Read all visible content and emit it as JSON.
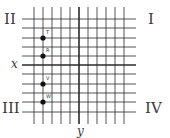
{
  "diagram": {
    "grid": {
      "vertical_lines_x": [
        34,
        43,
        52,
        61,
        70,
        79,
        88,
        97,
        106,
        115,
        124
      ],
      "horizontal_lines_y": [
        19,
        28,
        38,
        47,
        56,
        65,
        74,
        84,
        93,
        102,
        112
      ],
      "v_line_top": 7,
      "v_line_bottom": 124,
      "h_line_left": 22,
      "h_line_right": 136,
      "line_color": "#2a2a2a",
      "y_axis_x": 79,
      "x_axis_y": 65
    },
    "axes": {
      "x_label": "x",
      "y_label": "y"
    },
    "quadrants": {
      "I": "I",
      "II": "II",
      "III": "III",
      "IV": "IV"
    },
    "points": [
      {
        "label": "T",
        "x": 43,
        "y": 38
      },
      {
        "label": "R",
        "x": 43,
        "y": 56
      },
      {
        "label": "V",
        "x": 43,
        "y": 84
      },
      {
        "label": "W",
        "x": 43,
        "y": 102
      }
    ]
  }
}
